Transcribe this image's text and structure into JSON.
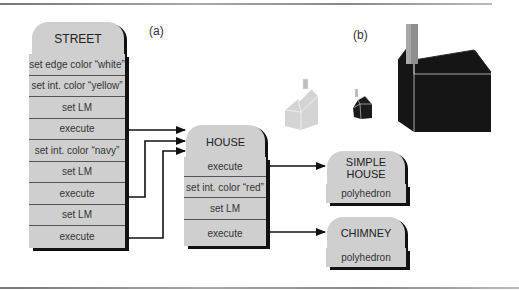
{
  "panel_labels": {
    "a": "(a)",
    "b": "(b)"
  },
  "street": {
    "title": "STREET",
    "rows": [
      "set edge color “white”",
      "set int. color “yellow”",
      "set LM",
      "execute",
      "set int. color “navy”",
      "set LM",
      "execute",
      "set LM",
      "execute"
    ]
  },
  "house": {
    "title": "HOUSE",
    "rows": [
      "execute",
      "set int. color “red”",
      "set LM",
      "execute"
    ]
  },
  "simple_house": {
    "title_line1": "SIMPLE",
    "title_line2": "HOUSE",
    "rows": [
      "polyhedron"
    ]
  },
  "chimney": {
    "title": "CHIMNEY",
    "rows": [
      "polyhedron"
    ]
  },
  "rendered_houses": [
    {
      "name": "white-yellow-house",
      "body_color": "#d6d6d6",
      "edge_color": "#f2f2f2"
    },
    {
      "name": "navy-house-small",
      "body_color": "#1a1a1a",
      "edge_color": "#e0e0e0"
    },
    {
      "name": "red-house-large",
      "body_color": "#141414",
      "edge_color": "#cfcfcf"
    }
  ]
}
